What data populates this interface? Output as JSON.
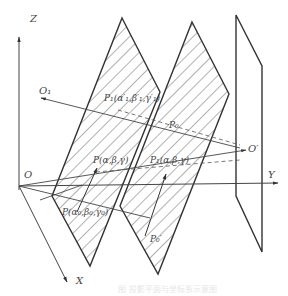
{
  "diagram": {
    "axes": {
      "z_label": "Z",
      "y_label": "Y",
      "x_label": "X",
      "origin_label": "O"
    },
    "points": {
      "o1": "O₁",
      "o_prime": "O′",
      "p1_top": "P₁(α′₁,β′₁,γ′₁)",
      "p0_top": "P₀",
      "p_mid": "P(α,β,γ)",
      "p1_mid": "P₁(α,β,γ)",
      "p_low": "P(α₀,β₀,γ₀)",
      "p0_low": "P₀′"
    },
    "planes": [
      {
        "name": "plane-1",
        "hatched": true
      },
      {
        "name": "plane-2",
        "hatched": true
      },
      {
        "name": "plane-3",
        "hatched": false
      }
    ],
    "caption": "图 投影平面与坐标系示意图",
    "colors": {
      "line": "#333333",
      "hatch": "#555555",
      "background": "#ffffff"
    }
  }
}
